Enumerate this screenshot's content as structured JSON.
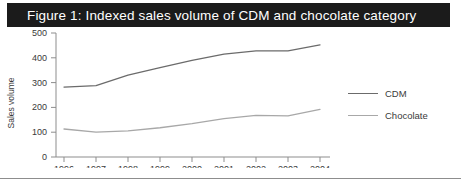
{
  "figure": {
    "title": "Figure 1: Indexed sales volume of CDM and chocolate category",
    "title_bar_color": "#1b1b1b",
    "title_text_color": "#ffffff",
    "background_color": "#ffffff"
  },
  "legend": {
    "position": "right",
    "items": [
      {
        "label": "CDM",
        "color": "#6b6b6b"
      },
      {
        "label": "Chocolate",
        "color": "#a8a8a8"
      }
    ]
  },
  "axes": {
    "y_label": "Sales volume",
    "y_ticks": [
      "0",
      "100",
      "200",
      "300",
      "400",
      "500"
    ],
    "x_ticks": [
      "1996",
      "1997",
      "1998",
      "1999",
      "2000",
      "2001",
      "2002",
      "2003",
      "2004"
    ]
  },
  "chart_data": {
    "type": "line",
    "title": "Figure 1: Indexed sales volume of CDM and chocolate category",
    "xlabel": "",
    "ylabel": "Sales volume",
    "categories": [
      "1996",
      "1997",
      "1998",
      "1999",
      "2000",
      "2001",
      "2002",
      "2003",
      "2004"
    ],
    "ylim": [
      0,
      500
    ],
    "yticks": [
      0,
      100,
      200,
      300,
      400,
      500
    ],
    "grid": false,
    "legend_position": "right",
    "series": [
      {
        "name": "CDM",
        "color": "#6b6b6b",
        "values": [
          282,
          288,
          330,
          360,
          390,
          415,
          428,
          428,
          452
        ]
      },
      {
        "name": "Chocolate",
        "color": "#a8a8a8",
        "values": [
          113,
          100,
          105,
          118,
          135,
          155,
          168,
          166,
          192
        ]
      }
    ]
  }
}
